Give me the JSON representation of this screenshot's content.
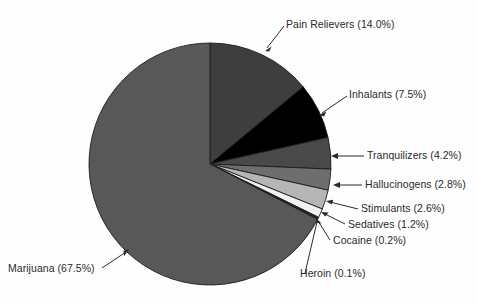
{
  "chart_data": {
    "type": "pie",
    "title": "",
    "subtitle": "",
    "xlabel": "",
    "ylabel": "",
    "legend_position": "none",
    "grid": false,
    "labels_include_percent": true,
    "start_angle_deg": 0,
    "direction": "clockwise",
    "categories": [
      "Pain Relievers",
      "Inhalants",
      "Tranquilizers",
      "Hallucinogens",
      "Stimulants",
      "Sedatives",
      "Cocaine",
      "Heroin",
      "Marijuana"
    ],
    "values": [
      14.0,
      7.5,
      4.2,
      2.8,
      2.6,
      1.2,
      0.2,
      0.1,
      67.5
    ],
    "units": "percent",
    "slices": [
      {
        "name": "Pain Relievers",
        "value": 14.0,
        "label": "Pain Relievers (14.0%)",
        "color": "#3f3f3f"
      },
      {
        "name": "Inhalants",
        "value": 7.5,
        "label": "Inhalants (7.5%)",
        "color": "#000000"
      },
      {
        "name": "Tranquilizers",
        "value": 4.2,
        "label": "Tranquilizers (4.2%)",
        "color": "#4a4a4a"
      },
      {
        "name": "Hallucinogens",
        "value": 2.8,
        "label": "Hallucinogens (2.8%)",
        "color": "#6f6f6f"
      },
      {
        "name": "Stimulants",
        "value": 2.6,
        "label": "Stimulants (2.6%)",
        "color": "#b7b7b7"
      },
      {
        "name": "Sedatives",
        "value": 1.2,
        "label": "Sedatives (1.2%)",
        "color": "#f2f2f2"
      },
      {
        "name": "Cocaine",
        "value": 0.2,
        "label": "Cocaine (0.2%)",
        "color": "#3a3a3a"
      },
      {
        "name": "Heroin",
        "value": 0.1,
        "label": "Heroin (0.1%)",
        "color": "#1a1a1a"
      },
      {
        "name": "Marijuana",
        "value": 67.5,
        "label": "Marijuana (67.5%)",
        "color": "#595959"
      }
    ]
  },
  "labels": {
    "pain_relievers": "Pain Relievers (14.0%)",
    "inhalants": "Inhalants (7.5%)",
    "tranquilizers": "Tranquilizers (4.2%)",
    "hallucinogens": "Hallucinogens (2.8%)",
    "stimulants": "Stimulants (2.6%)",
    "sedatives": "Sedatives (1.2%)",
    "cocaine": "Cocaine (0.2%)",
    "heroin": "Heroin (0.1%)",
    "marijuana": "Marijuana (67.5%)"
  },
  "colors": {
    "background": "#ffffff",
    "text": "#2b2b2b",
    "outline": "#1d1d1d",
    "leader_line": "#2b2b2b"
  }
}
